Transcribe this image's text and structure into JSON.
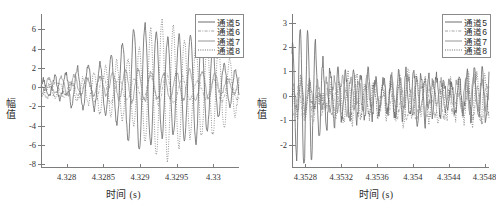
{
  "chart_data": [
    {
      "type": "line",
      "panel": "left",
      "title": "",
      "xlabel": "时间 (s)",
      "ylabel": "幅 值",
      "xlim": [
        4.32765,
        4.33035
      ],
      "ylim": [
        -8.4,
        7.6
      ],
      "xticks": [
        4.328,
        4.3285,
        4.329,
        4.3295,
        4.33
      ],
      "xticklabels": [
        "4.328",
        "4.3285",
        "4.329",
        "4.3295",
        "4.33"
      ],
      "yticks": [
        -8,
        -6,
        -4,
        -2,
        0,
        2,
        4,
        6
      ],
      "yticklabels": [
        "-8",
        "-6",
        "-4",
        "-2",
        "0",
        "2",
        "4",
        "6"
      ],
      "grid": false,
      "legend_position": "upper right",
      "series": [
        {
          "name": "通道5",
          "style": "solid",
          "color": "#6f6f6f",
          "wave": {
            "carrier_cycles": 17.5,
            "phase": 0.35,
            "env_center": 0.61,
            "env_width": 0.33,
            "env_peak": 6.1,
            "env_floor": 0.75,
            "noise": 0.52,
            "seed": 11
          }
        },
        {
          "name": "通道6",
          "style": "dashdot",
          "color": "#9a9a9a",
          "wave": {
            "carrier_cycles": 12.5,
            "phase": 2.1,
            "env_center": 0.55,
            "env_width": 0.45,
            "env_peak": 1.35,
            "env_floor": 0.55,
            "noise": 0.3,
            "seed": 27,
            "offset": -0.25
          }
        },
        {
          "name": "通道7",
          "style": "solid-thin",
          "color": "#8b8b8b",
          "wave": {
            "carrier_cycles": 15.5,
            "phase": 4.0,
            "env_center": 0.6,
            "env_width": 0.4,
            "env_peak": 1.55,
            "env_floor": 0.6,
            "noise": 0.36,
            "seed": 43,
            "offset": 0.15
          }
        },
        {
          "name": "通道8",
          "style": "dotted",
          "color": "#5c5c5c",
          "wave": {
            "carrier_cycles": 17.5,
            "phase": 3.55,
            "env_center": 0.66,
            "env_width": 0.3,
            "env_peak": 6.4,
            "env_floor": 0.6,
            "noise": 0.5,
            "seed": 59,
            "offset": -0.3
          }
        }
      ],
      "annotations": {
        "peak_max": 7.1,
        "peak_min": -7.2
      }
    },
    {
      "type": "line",
      "panel": "right",
      "title": "",
      "xlabel": "时间 (s)",
      "ylabel": "幅 值",
      "xlim": [
        4.35265,
        4.35485
      ],
      "ylim": [
        -2.95,
        3.35
      ],
      "xticks": [
        4.3528,
        4.3532,
        4.3536,
        4.354,
        4.3544,
        4.3548
      ],
      "xticklabels": [
        "4.3528",
        "4.3532",
        "4.3536",
        "4.354",
        "4.3544",
        "4.3548"
      ],
      "yticks": [
        -2,
        -1,
        0,
        1,
        2,
        3
      ],
      "yticklabels": [
        "-2",
        "-1",
        "0",
        "1",
        "2",
        "3"
      ],
      "grid": false,
      "legend_position": "upper right",
      "series": [
        {
          "name": "通道5",
          "style": "solid",
          "color": "#6f6f6f",
          "wave": {
            "carrier_cycles": 26,
            "phase": 1.1,
            "env_center": 0.08,
            "env_width": 0.09,
            "env_peak": 2.9,
            "env_floor": 0.85,
            "noise": 0.45,
            "seed": 71
          }
        },
        {
          "name": "通道6",
          "style": "dashdot",
          "color": "#9a9a9a",
          "wave": {
            "carrier_cycles": 21,
            "phase": 3.2,
            "env_center": 0.5,
            "env_width": 0.6,
            "env_peak": 0.55,
            "env_floor": 0.55,
            "noise": 0.3,
            "seed": 83,
            "offset": -0.3
          }
        },
        {
          "name": "通道7",
          "style": "solid-thin",
          "color": "#8b8b8b",
          "wave": {
            "carrier_cycles": 24,
            "phase": 0.6,
            "env_center": 0.5,
            "env_width": 0.7,
            "env_peak": 0.6,
            "env_floor": 0.6,
            "noise": 0.34,
            "seed": 97,
            "offset": 0.05
          }
        },
        {
          "name": "通道8",
          "style": "dotted",
          "color": "#5c5c5c",
          "wave": {
            "carrier_cycles": 23,
            "phase": 4.4,
            "env_center": 0.06,
            "env_width": 0.1,
            "env_peak": -2.4,
            "env_floor": 0.8,
            "noise": 0.42,
            "seed": 109,
            "offset": -0.15
          }
        }
      ],
      "annotations": {
        "peak_max": 3.05,
        "peak_min": -2.75
      }
    }
  ]
}
